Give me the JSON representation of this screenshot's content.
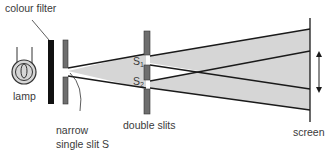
{
  "diagram": {
    "labels": {
      "colour_filter": "colour filter",
      "lamp": "lamp",
      "narrow_slit_line1": "narrow",
      "narrow_slit_line2": "single slit S",
      "double_slits": "double slits",
      "s1": "S",
      "s1_sub": "1",
      "s2": "S",
      "s2_sub": "2",
      "screen": "screen"
    },
    "components": [
      "lamp",
      "colour filter",
      "narrow single slit S",
      "double slits",
      "screen"
    ],
    "colors": {
      "beam_fill": "#d6d6d6",
      "plate_fill": "#6e6e6e",
      "filter_fill": "#111111",
      "line": "#1a1a1a",
      "text": "#3a3a3a"
    }
  }
}
